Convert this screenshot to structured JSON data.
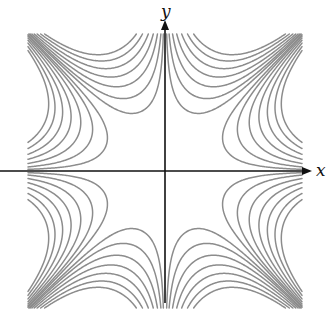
{
  "figure": {
    "function": "f(x,y) = x*y*(x^2 - y^2)",
    "x_label": "x",
    "y_label": "y",
    "domain": {
      "x": [
        -1,
        1
      ],
      "y": [
        -1,
        1
      ]
    },
    "contour_levels": [
      -0.2,
      -0.16,
      -0.12,
      -0.085,
      -0.055,
      -0.03,
      -0.012,
      0.012,
      0.03,
      0.055,
      0.085,
      0.12,
      0.16,
      0.2
    ],
    "colors": {
      "background": "#ffffff",
      "contour": "#8c8c8c",
      "axis": "#111111"
    },
    "layout_px": {
      "origin": [
        165,
        171
      ],
      "half_extent": 137,
      "x_axis_end": 312,
      "x_axis_start": 0,
      "y_axis_top": 20,
      "y_axis_bottom": 303
    }
  }
}
